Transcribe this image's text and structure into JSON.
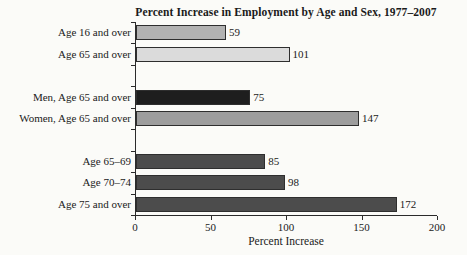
{
  "chart_data": {
    "type": "bar",
    "orientation": "horizontal",
    "title": "Percent Increase in Employment by Age and Sex, 1977–2007",
    "xlabel": "Percent Increase",
    "xlim": [
      0,
      200
    ],
    "xticks": [
      0,
      50,
      100,
      150,
      200
    ],
    "grid": false,
    "legend": "none",
    "value_labels_shown": true,
    "axis_color": "#2b2b2b",
    "bar_border_color": "#2e2e2e",
    "rows": [
      {
        "label": "Age 16 and over",
        "value": 59,
        "color": "#b2b2b2",
        "gap": false
      },
      {
        "label": "Age 65 and over",
        "value": 101,
        "color": "#dbdbdb",
        "gap": false
      },
      {
        "label": "",
        "value": null,
        "color": "",
        "gap": true
      },
      {
        "label": "Men, Age 65 and over",
        "value": 75,
        "color": "#1e1e1e",
        "gap": false
      },
      {
        "label": "Women, Age 65 and over",
        "value": 147,
        "color": "#9d9d9d",
        "gap": false
      },
      {
        "label": "",
        "value": null,
        "color": "",
        "gap": true
      },
      {
        "label": "Age 65–69",
        "value": 85,
        "color": "#4c4c4c",
        "gap": false
      },
      {
        "label": "Age 70–74",
        "value": 98,
        "color": "#4c4c4c",
        "gap": false
      },
      {
        "label": "Age 75 and over",
        "value": 172,
        "color": "#4c4c4c",
        "gap": false
      }
    ]
  }
}
